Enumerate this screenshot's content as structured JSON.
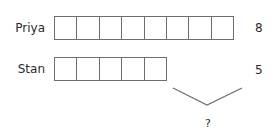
{
  "rows": [
    {
      "name": "Priya",
      "value": "8",
      "cells": 8
    },
    {
      "name": "Stan",
      "value": "5",
      "cells": 5
    }
  ],
  "brace": {
    "label": "?"
  },
  "colors": {
    "line": "#6e6e6e",
    "text": "#2b2b2b",
    "background": "#ffffff"
  }
}
